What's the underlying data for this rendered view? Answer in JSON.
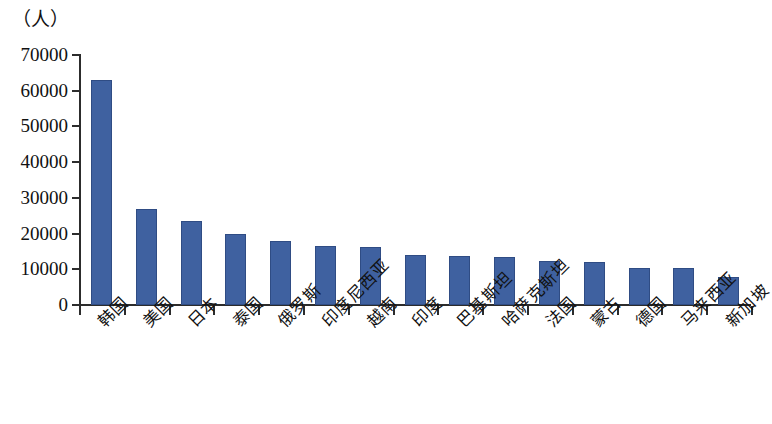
{
  "chart_data": {
    "type": "bar",
    "title": "",
    "subtitle": "",
    "unit_label": "（人）",
    "xlabel": "",
    "ylabel": "",
    "ylim": [
      0,
      70000
    ],
    "ytick_step": 10000,
    "ytick_labels": [
      "70000",
      "60000",
      "50000",
      "40000",
      "30000",
      "20000",
      "10000",
      "0"
    ],
    "ytick_values": [
      70000,
      60000,
      50000,
      40000,
      30000,
      20000,
      10000,
      0
    ],
    "grid": false,
    "legend": null,
    "bar_color": "#3f61a0",
    "axis_color": "#2c2c2c",
    "categories": [
      "韩国",
      "美国",
      "日本",
      "泰国",
      "俄罗斯",
      "印度尼西亚",
      "越南",
      "印度",
      "巴基斯坦",
      "哈萨克斯坦",
      "法国",
      "蒙古",
      "德国",
      "马来西亚",
      "新加坡"
    ],
    "values": [
      63000,
      27000,
      23500,
      20000,
      18000,
      16500,
      16300,
      14000,
      13700,
      13500,
      12200,
      12000,
      10500,
      10400,
      7800
    ],
    "series": [
      {
        "name": "",
        "values": [
          63000,
          27000,
          23500,
          20000,
          18000,
          16500,
          16300,
          14000,
          13700,
          13500,
          12200,
          12000,
          10500,
          10400,
          7800
        ]
      }
    ]
  }
}
